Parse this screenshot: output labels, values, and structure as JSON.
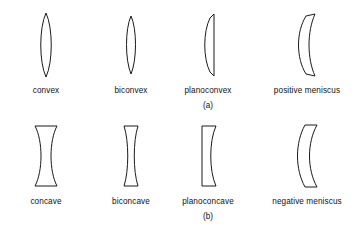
{
  "figure": {
    "stroke_color": "#1a1a1a",
    "fill_color": "#ffffff",
    "background_color": "#ffffff"
  },
  "panels": [
    {
      "caption": "(a)",
      "caption_name": "panel-caption-a",
      "group": "converging-lenses",
      "lenses": [
        {
          "label": "convex",
          "shape": "convex"
        },
        {
          "label": "biconvex",
          "shape": "biconvex"
        },
        {
          "label": "planoconvex",
          "shape": "planoconvex"
        },
        {
          "label": "positive meniscus",
          "shape": "positive-meniscus"
        }
      ]
    },
    {
      "caption": "(b)",
      "caption_name": "panel-caption-b",
      "group": "diverging-lenses",
      "lenses": [
        {
          "label": "concave",
          "shape": "concave"
        },
        {
          "label": "biconcave",
          "shape": "biconcave"
        },
        {
          "label": "planoconcave",
          "shape": "planoconcave"
        },
        {
          "label": "negative meniscus",
          "shape": "negative-meniscus"
        }
      ]
    }
  ]
}
